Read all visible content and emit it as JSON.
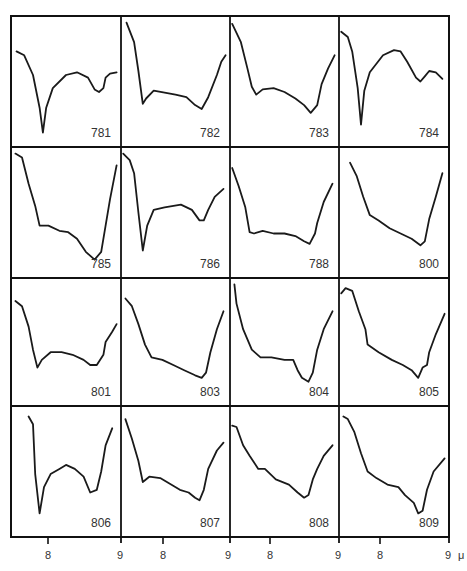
{
  "chart_data": {
    "type": "line",
    "title": "",
    "xlabel": "μ",
    "ylabel": "",
    "grid": {
      "rows": 4,
      "cols": 4
    },
    "x_ticks": [
      {
        "label": "8",
        "x": 48
      },
      {
        "label": "9",
        "x": 120
      },
      {
        "label": "8",
        "x": 163
      },
      {
        "label": "9",
        "x": 228
      },
      {
        "label": "8",
        "x": 270
      },
      {
        "label": "9",
        "x": 338
      },
      {
        "label": "8",
        "x": 380
      },
      {
        "label": "9",
        "x": 448
      }
    ],
    "unit_label": "μ",
    "panels": [
      {
        "label": "781",
        "points": [
          [
            0.05,
            0.27
          ],
          [
            0.12,
            0.3
          ],
          [
            0.2,
            0.45
          ],
          [
            0.26,
            0.7
          ],
          [
            0.29,
            0.89
          ],
          [
            0.32,
            0.7
          ],
          [
            0.38,
            0.55
          ],
          [
            0.5,
            0.45
          ],
          [
            0.6,
            0.43
          ],
          [
            0.7,
            0.47
          ],
          [
            0.76,
            0.56
          ],
          [
            0.8,
            0.58
          ],
          [
            0.84,
            0.55
          ],
          [
            0.86,
            0.47
          ],
          [
            0.9,
            0.44
          ],
          [
            0.96,
            0.43
          ]
        ]
      },
      {
        "label": "782",
        "points": [
          [
            0.05,
            0.05
          ],
          [
            0.12,
            0.2
          ],
          [
            0.16,
            0.42
          ],
          [
            0.2,
            0.67
          ],
          [
            0.23,
            0.63
          ],
          [
            0.3,
            0.57
          ],
          [
            0.5,
            0.6
          ],
          [
            0.6,
            0.62
          ],
          [
            0.68,
            0.68
          ],
          [
            0.74,
            0.71
          ],
          [
            0.8,
            0.62
          ],
          [
            0.88,
            0.45
          ],
          [
            0.92,
            0.35
          ],
          [
            0.96,
            0.3
          ]
        ]
      },
      {
        "label": "783",
        "points": [
          [
            0.02,
            0.06
          ],
          [
            0.1,
            0.2
          ],
          [
            0.16,
            0.4
          ],
          [
            0.2,
            0.54
          ],
          [
            0.24,
            0.6
          ],
          [
            0.3,
            0.56
          ],
          [
            0.4,
            0.55
          ],
          [
            0.5,
            0.58
          ],
          [
            0.6,
            0.63
          ],
          [
            0.68,
            0.68
          ],
          [
            0.74,
            0.74
          ],
          [
            0.8,
            0.68
          ],
          [
            0.84,
            0.52
          ],
          [
            0.9,
            0.4
          ],
          [
            0.96,
            0.3
          ]
        ]
      },
      {
        "label": "784",
        "points": [
          [
            0.02,
            0.12
          ],
          [
            0.08,
            0.16
          ],
          [
            0.12,
            0.27
          ],
          [
            0.17,
            0.55
          ],
          [
            0.2,
            0.83
          ],
          [
            0.23,
            0.57
          ],
          [
            0.28,
            0.43
          ],
          [
            0.4,
            0.3
          ],
          [
            0.5,
            0.26
          ],
          [
            0.56,
            0.27
          ],
          [
            0.62,
            0.35
          ],
          [
            0.7,
            0.47
          ],
          [
            0.74,
            0.5
          ],
          [
            0.78,
            0.46
          ],
          [
            0.82,
            0.42
          ],
          [
            0.88,
            0.43
          ],
          [
            0.94,
            0.48
          ]
        ]
      },
      {
        "label": "785",
        "points": [
          [
            0.04,
            0.05
          ],
          [
            0.1,
            0.08
          ],
          [
            0.16,
            0.28
          ],
          [
            0.22,
            0.45
          ],
          [
            0.26,
            0.6
          ],
          [
            0.34,
            0.6
          ],
          [
            0.44,
            0.64
          ],
          [
            0.52,
            0.65
          ],
          [
            0.6,
            0.7
          ],
          [
            0.68,
            0.8
          ],
          [
            0.76,
            0.86
          ],
          [
            0.82,
            0.8
          ],
          [
            0.86,
            0.6
          ],
          [
            0.9,
            0.4
          ],
          [
            0.96,
            0.14
          ]
        ]
      },
      {
        "label": "786",
        "points": [
          [
            0.02,
            0.05
          ],
          [
            0.08,
            0.1
          ],
          [
            0.12,
            0.2
          ],
          [
            0.16,
            0.5
          ],
          [
            0.2,
            0.79
          ],
          [
            0.24,
            0.6
          ],
          [
            0.3,
            0.48
          ],
          [
            0.4,
            0.46
          ],
          [
            0.55,
            0.44
          ],
          [
            0.65,
            0.48
          ],
          [
            0.72,
            0.56
          ],
          [
            0.76,
            0.56
          ],
          [
            0.8,
            0.48
          ],
          [
            0.86,
            0.38
          ],
          [
            0.94,
            0.32
          ]
        ]
      },
      {
        "label": "788",
        "points": [
          [
            0.02,
            0.16
          ],
          [
            0.08,
            0.3
          ],
          [
            0.14,
            0.46
          ],
          [
            0.18,
            0.65
          ],
          [
            0.22,
            0.66
          ],
          [
            0.3,
            0.64
          ],
          [
            0.4,
            0.66
          ],
          [
            0.5,
            0.66
          ],
          [
            0.6,
            0.68
          ],
          [
            0.68,
            0.72
          ],
          [
            0.73,
            0.74
          ],
          [
            0.78,
            0.66
          ],
          [
            0.8,
            0.58
          ],
          [
            0.86,
            0.42
          ],
          [
            0.94,
            0.28
          ]
        ]
      },
      {
        "label": "800",
        "points": [
          [
            0.1,
            0.12
          ],
          [
            0.16,
            0.22
          ],
          [
            0.22,
            0.38
          ],
          [
            0.28,
            0.52
          ],
          [
            0.36,
            0.56
          ],
          [
            0.46,
            0.62
          ],
          [
            0.56,
            0.66
          ],
          [
            0.66,
            0.7
          ],
          [
            0.74,
            0.75
          ],
          [
            0.78,
            0.72
          ],
          [
            0.82,
            0.55
          ],
          [
            0.88,
            0.38
          ],
          [
            0.94,
            0.2
          ]
        ]
      },
      {
        "label": "801",
        "points": [
          [
            0.04,
            0.18
          ],
          [
            0.1,
            0.22
          ],
          [
            0.16,
            0.38
          ],
          [
            0.2,
            0.56
          ],
          [
            0.24,
            0.7
          ],
          [
            0.28,
            0.64
          ],
          [
            0.36,
            0.58
          ],
          [
            0.46,
            0.58
          ],
          [
            0.56,
            0.6
          ],
          [
            0.66,
            0.64
          ],
          [
            0.72,
            0.68
          ],
          [
            0.78,
            0.68
          ],
          [
            0.84,
            0.6
          ],
          [
            0.86,
            0.5
          ],
          [
            0.92,
            0.42
          ],
          [
            0.96,
            0.36
          ]
        ]
      },
      {
        "label": "803",
        "points": [
          [
            0.04,
            0.16
          ],
          [
            0.1,
            0.22
          ],
          [
            0.16,
            0.36
          ],
          [
            0.22,
            0.52
          ],
          [
            0.28,
            0.62
          ],
          [
            0.38,
            0.64
          ],
          [
            0.48,
            0.68
          ],
          [
            0.58,
            0.72
          ],
          [
            0.68,
            0.76
          ],
          [
            0.74,
            0.78
          ],
          [
            0.78,
            0.74
          ],
          [
            0.82,
            0.58
          ],
          [
            0.88,
            0.4
          ],
          [
            0.94,
            0.26
          ]
        ]
      },
      {
        "label": "804",
        "points": [
          [
            0.04,
            0.05
          ],
          [
            0.06,
            0.2
          ],
          [
            0.12,
            0.4
          ],
          [
            0.2,
            0.56
          ],
          [
            0.28,
            0.62
          ],
          [
            0.38,
            0.62
          ],
          [
            0.5,
            0.64
          ],
          [
            0.58,
            0.64
          ],
          [
            0.62,
            0.72
          ],
          [
            0.66,
            0.78
          ],
          [
            0.72,
            0.81
          ],
          [
            0.76,
            0.74
          ],
          [
            0.8,
            0.56
          ],
          [
            0.86,
            0.4
          ],
          [
            0.94,
            0.26
          ]
        ]
      },
      {
        "label": "805",
        "points": [
          [
            0.02,
            0.12
          ],
          [
            0.06,
            0.08
          ],
          [
            0.12,
            0.1
          ],
          [
            0.18,
            0.26
          ],
          [
            0.24,
            0.4
          ],
          [
            0.26,
            0.52
          ],
          [
            0.36,
            0.58
          ],
          [
            0.48,
            0.64
          ],
          [
            0.58,
            0.68
          ],
          [
            0.66,
            0.72
          ],
          [
            0.72,
            0.78
          ],
          [
            0.76,
            0.7
          ],
          [
            0.8,
            0.68
          ],
          [
            0.82,
            0.58
          ],
          [
            0.88,
            0.44
          ],
          [
            0.96,
            0.28
          ]
        ]
      },
      {
        "label": "806",
        "points": [
          [
            0.16,
            0.08
          ],
          [
            0.2,
            0.14
          ],
          [
            0.22,
            0.52
          ],
          [
            0.26,
            0.82
          ],
          [
            0.3,
            0.62
          ],
          [
            0.36,
            0.52
          ],
          [
            0.44,
            0.48
          ],
          [
            0.5,
            0.45
          ],
          [
            0.58,
            0.48
          ],
          [
            0.66,
            0.54
          ],
          [
            0.72,
            0.66
          ],
          [
            0.78,
            0.64
          ],
          [
            0.82,
            0.5
          ],
          [
            0.86,
            0.3
          ],
          [
            0.92,
            0.17
          ]
        ]
      },
      {
        "label": "807",
        "points": [
          [
            0.04,
            0.1
          ],
          [
            0.1,
            0.25
          ],
          [
            0.16,
            0.42
          ],
          [
            0.2,
            0.58
          ],
          [
            0.26,
            0.54
          ],
          [
            0.36,
            0.55
          ],
          [
            0.46,
            0.6
          ],
          [
            0.54,
            0.64
          ],
          [
            0.62,
            0.66
          ],
          [
            0.68,
            0.7
          ],
          [
            0.72,
            0.72
          ],
          [
            0.76,
            0.64
          ],
          [
            0.8,
            0.48
          ],
          [
            0.88,
            0.34
          ],
          [
            0.94,
            0.28
          ]
        ]
      },
      {
        "label": "808",
        "points": [
          [
            0.02,
            0.15
          ],
          [
            0.06,
            0.16
          ],
          [
            0.12,
            0.3
          ],
          [
            0.18,
            0.38
          ],
          [
            0.26,
            0.48
          ],
          [
            0.32,
            0.48
          ],
          [
            0.42,
            0.56
          ],
          [
            0.54,
            0.6
          ],
          [
            0.62,
            0.66
          ],
          [
            0.68,
            0.7
          ],
          [
            0.72,
            0.68
          ],
          [
            0.76,
            0.56
          ],
          [
            0.8,
            0.48
          ],
          [
            0.86,
            0.38
          ],
          [
            0.94,
            0.3
          ]
        ]
      },
      {
        "label": "809",
        "points": [
          [
            0.04,
            0.08
          ],
          [
            0.08,
            0.1
          ],
          [
            0.14,
            0.2
          ],
          [
            0.2,
            0.36
          ],
          [
            0.26,
            0.5
          ],
          [
            0.34,
            0.55
          ],
          [
            0.44,
            0.6
          ],
          [
            0.54,
            0.62
          ],
          [
            0.6,
            0.68
          ],
          [
            0.68,
            0.74
          ],
          [
            0.72,
            0.82
          ],
          [
            0.76,
            0.8
          ],
          [
            0.8,
            0.64
          ],
          [
            0.86,
            0.5
          ],
          [
            0.96,
            0.4
          ]
        ]
      }
    ]
  },
  "colors": {
    "line": "#1a1a1a",
    "grid": "#111111",
    "text": "#333333",
    "background": "#ffffff"
  }
}
